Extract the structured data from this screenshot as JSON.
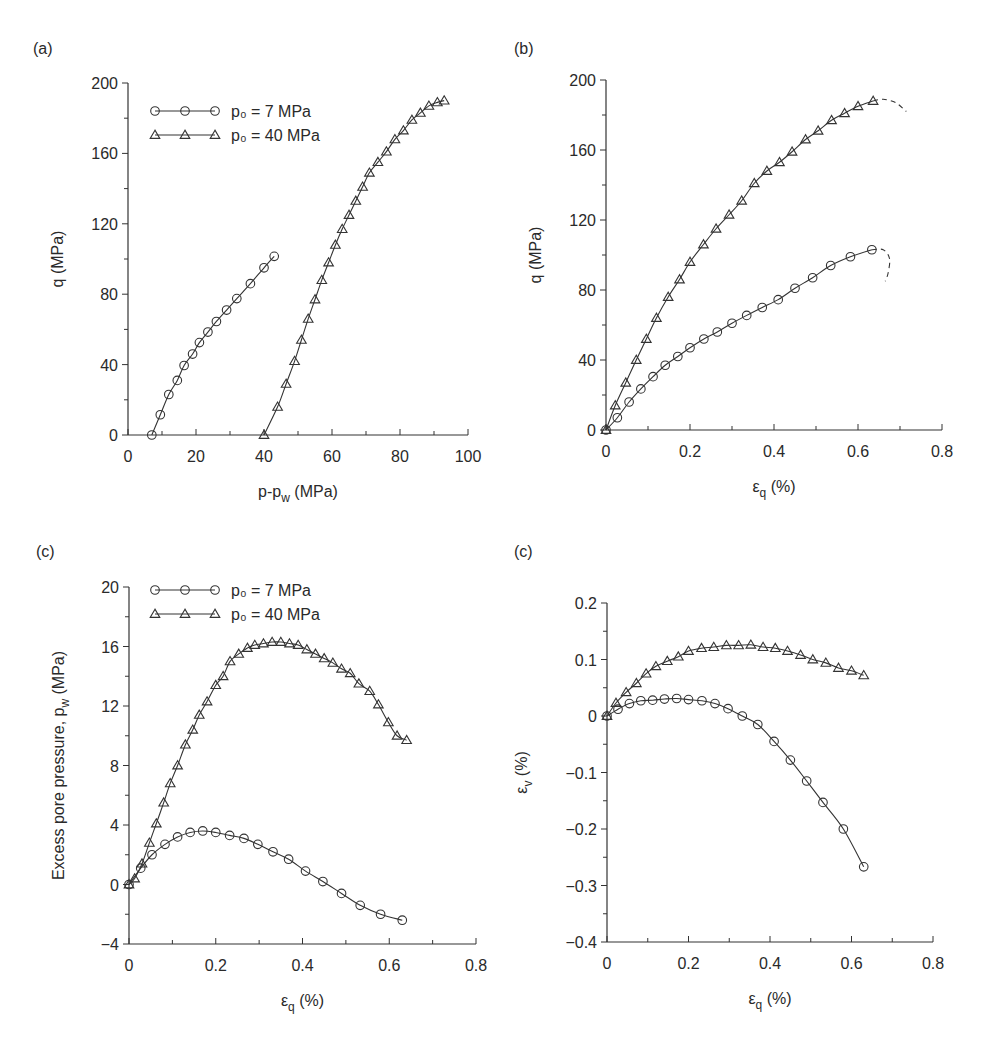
{
  "figure": {
    "panels": [
      {
        "label": "(a)"
      },
      {
        "label": "(b)"
      },
      {
        "label": "(c)"
      },
      {
        "label": "(c)"
      }
    ]
  },
  "legend": {
    "series1": "p₀ = 7 MPa",
    "series2": "p₀ = 40 MPa"
  },
  "chart_data": [
    {
      "panel": "(a)",
      "type": "line",
      "xlabel": "p-p_w (MPa)",
      "ylabel": "q (MPa)",
      "xlim": [
        0,
        100
      ],
      "ylim": [
        0,
        200
      ],
      "xticks": [
        0,
        20,
        40,
        60,
        80,
        100
      ],
      "yticks": [
        0,
        40,
        80,
        120,
        160,
        200
      ],
      "grid": false,
      "legend_position": "upper left",
      "series": [
        {
          "name": "p0 = 7 MPa",
          "marker": "circle",
          "x": [
            7,
            9.5,
            12,
            14.5,
            16.5,
            19,
            21,
            23.5,
            26,
            29,
            32,
            36,
            40,
            43
          ],
          "y": [
            0,
            11.5,
            23,
            31,
            39.5,
            46,
            52.5,
            58.5,
            64.5,
            71,
            77.5,
            86,
            95,
            101.5
          ]
        },
        {
          "name": "p0 = 40 MPa",
          "marker": "triangle",
          "x": [
            40,
            44,
            46.5,
            49,
            51,
            53,
            55,
            57,
            59,
            61,
            63,
            65,
            67,
            69,
            71,
            73.5,
            76,
            78.5,
            81,
            83.5,
            86,
            88.5,
            91,
            93
          ],
          "y": [
            0,
            16,
            29,
            42,
            54,
            66,
            77,
            88,
            98,
            108,
            117,
            125,
            133,
            141,
            149,
            155,
            161,
            168,
            173,
            179,
            183,
            187,
            189,
            190
          ]
        }
      ]
    },
    {
      "panel": "(b)",
      "type": "line",
      "xlabel": "ε_q (%)",
      "ylabel": "q (MPa)",
      "xlim": [
        0,
        0.8
      ],
      "ylim": [
        0,
        200
      ],
      "xticks": [
        0,
        0.2,
        0.4,
        0.6,
        0.8
      ],
      "yticks": [
        0,
        40,
        80,
        120,
        160,
        200
      ],
      "grid": false,
      "series": [
        {
          "name": "p0 = 7 MPa",
          "marker": "circle",
          "x": [
            0,
            0.027,
            0.055,
            0.083,
            0.112,
            0.141,
            0.171,
            0.2,
            0.233,
            0.265,
            0.3,
            0.335,
            0.372,
            0.41,
            0.45,
            0.492,
            0.535,
            0.582,
            0.633
          ],
          "y": [
            0,
            7,
            16,
            23.5,
            30.5,
            37,
            42,
            47,
            52,
            56,
            61,
            65.5,
            70,
            74.5,
            81,
            87,
            94,
            99,
            103
          ]
        },
        {
          "name": "p0 = 40 MPa",
          "marker": "triangle",
          "x": [
            0,
            0.022,
            0.047,
            0.072,
            0.096,
            0.12,
            0.148,
            0.175,
            0.2,
            0.232,
            0.262,
            0.293,
            0.323,
            0.353,
            0.383,
            0.413,
            0.443,
            0.475,
            0.505,
            0.537,
            0.568,
            0.6,
            0.636
          ],
          "y": [
            0,
            14,
            27,
            40,
            52,
            64,
            76,
            86,
            96,
            106,
            115,
            123,
            131,
            141,
            148,
            153,
            159,
            166,
            171,
            177,
            181,
            185,
            188
          ]
        },
        {
          "name": "p0 = 7 MPa post-peak (dashed)",
          "style": "dashed",
          "x": [
            0.633,
            0.66,
            0.675,
            0.672,
            0.665
          ],
          "y": [
            103,
            103,
            98,
            90,
            85
          ]
        },
        {
          "name": "p0 = 40 MPa post-peak (dashed)",
          "style": "dashed",
          "x": [
            0.636,
            0.66,
            0.69,
            0.715
          ],
          "y": [
            188,
            189,
            187,
            182
          ]
        }
      ]
    },
    {
      "panel": "(c) left",
      "type": "line",
      "xlabel": "ε_q (%)",
      "ylabel": "Excess pore pressure, p_w (MPa)",
      "xlim": [
        0,
        0.8
      ],
      "ylim": [
        -4,
        20
      ],
      "xticks": [
        0,
        0.2,
        0.4,
        0.6,
        0.8
      ],
      "yticks": [
        -4,
        0,
        4,
        8,
        12,
        16,
        20
      ],
      "grid": false,
      "legend_position": "upper left",
      "series": [
        {
          "name": "p0 = 7 MPa",
          "marker": "circle",
          "x": [
            0,
            0.027,
            0.053,
            0.083,
            0.112,
            0.141,
            0.17,
            0.2,
            0.232,
            0.265,
            0.297,
            0.332,
            0.368,
            0.407,
            0.447,
            0.49,
            0.533,
            0.58,
            0.63
          ],
          "y": [
            0,
            1.1,
            2.0,
            2.7,
            3.2,
            3.5,
            3.6,
            3.5,
            3.3,
            3.1,
            2.7,
            2.2,
            1.7,
            0.9,
            0.2,
            -0.6,
            -1.4,
            -2.0,
            -2.4
          ]
        },
        {
          "name": "p0 = 40 MPa",
          "marker": "triangle",
          "x": [
            0,
            0.013,
            0.03,
            0.047,
            0.063,
            0.08,
            0.095,
            0.112,
            0.13,
            0.147,
            0.162,
            0.18,
            0.2,
            0.217,
            0.233,
            0.253,
            0.273,
            0.29,
            0.31,
            0.33,
            0.35,
            0.37,
            0.39,
            0.41,
            0.43,
            0.45,
            0.47,
            0.49,
            0.51,
            0.53,
            0.555,
            0.575,
            0.598,
            0.618,
            0.64
          ],
          "y": [
            0,
            0.4,
            1.4,
            2.8,
            4.1,
            5.5,
            6.8,
            8.0,
            9.4,
            10.4,
            11.4,
            12.3,
            13.4,
            14.0,
            15.0,
            15.5,
            15.9,
            16.1,
            16.2,
            16.3,
            16.3,
            16.2,
            16.1,
            15.8,
            15.5,
            15.2,
            14.9,
            14.5,
            14.2,
            13.5,
            13.0,
            12.1,
            10.9,
            10.0,
            9.7
          ]
        }
      ]
    },
    {
      "panel": "(c) right",
      "type": "line",
      "xlabel": "ε_q (%)",
      "ylabel": "ε_v (%)",
      "xlim": [
        0,
        0.8
      ],
      "ylim": [
        -0.4,
        0.2
      ],
      "xticks": [
        0,
        0.2,
        0.4,
        0.6,
        0.8
      ],
      "yticks": [
        -0.4,
        -0.3,
        -0.2,
        -0.1,
        0,
        0.1,
        0.2
      ],
      "grid": false,
      "series": [
        {
          "name": "p0 = 7 MPa",
          "marker": "circle",
          "x": [
            0,
            0.027,
            0.055,
            0.083,
            0.112,
            0.141,
            0.171,
            0.2,
            0.233,
            0.265,
            0.297,
            0.332,
            0.37,
            0.41,
            0.45,
            0.49,
            0.53,
            0.58,
            0.63
          ],
          "y": [
            0,
            0.012,
            0.022,
            0.027,
            0.028,
            0.03,
            0.031,
            0.029,
            0.027,
            0.022,
            0.013,
            0,
            -0.015,
            -0.045,
            -0.078,
            -0.115,
            -0.153,
            -0.2,
            -0.267
          ]
        },
        {
          "name": "p0 = 40 MPa",
          "marker": "triangle",
          "x": [
            0,
            0.022,
            0.047,
            0.072,
            0.096,
            0.12,
            0.148,
            0.175,
            0.2,
            0.232,
            0.262,
            0.293,
            0.323,
            0.353,
            0.383,
            0.413,
            0.443,
            0.475,
            0.505,
            0.537,
            0.568,
            0.6,
            0.63
          ],
          "y": [
            0,
            0.023,
            0.042,
            0.058,
            0.075,
            0.088,
            0.097,
            0.105,
            0.115,
            0.12,
            0.122,
            0.125,
            0.125,
            0.126,
            0.122,
            0.12,
            0.115,
            0.108,
            0.1,
            0.094,
            0.085,
            0.08,
            0.072
          ]
        }
      ]
    }
  ]
}
